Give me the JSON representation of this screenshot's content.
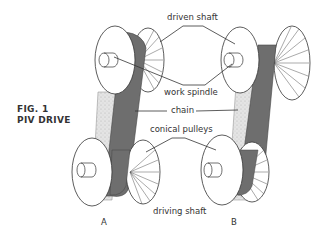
{
  "figure": {
    "caption_line1": "FIG. 1",
    "caption_line2": "PIV DRIVE"
  },
  "labels": {
    "driven_shaft": "driven shaft",
    "work_spindle": "work spindle",
    "chain": "chain",
    "conical_pulleys": "conical pulleys",
    "driving_shaft": "driving shaft"
  },
  "variants": {
    "a": "A",
    "b": "B"
  },
  "colors": {
    "chain_dark": "#6e6e6e",
    "chain_light": "#e2e2e2",
    "line": "#333333"
  }
}
